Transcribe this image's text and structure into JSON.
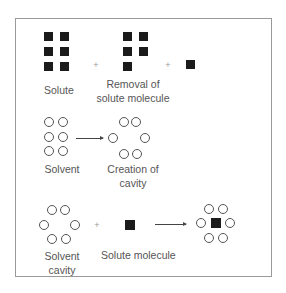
{
  "diagram": {
    "rows": [
      {
        "labels": {
          "solute": "Solute",
          "removal_line1": "Removal of",
          "removal_line2": "solute molecule"
        },
        "operators": [
          "+",
          "+"
        ]
      },
      {
        "labels": {
          "solvent": "Solvent",
          "creation_line1": "Creation of",
          "creation_line2": "cavity"
        },
        "operators": [
          "→"
        ]
      },
      {
        "labels": {
          "cavity_line1": "Solvent",
          "cavity_line2": "cavity",
          "solute_molecule": "Solute molecule"
        },
        "operators": [
          "+",
          "→"
        ]
      }
    ],
    "legend": {
      "filled_square": "solute molecule",
      "open_circle": "solvent molecule"
    },
    "colors": {
      "solute": "#1b1b1b",
      "solvent_outline": "#555555",
      "frame": "#9a9a9a",
      "text": "#555555"
    }
  }
}
